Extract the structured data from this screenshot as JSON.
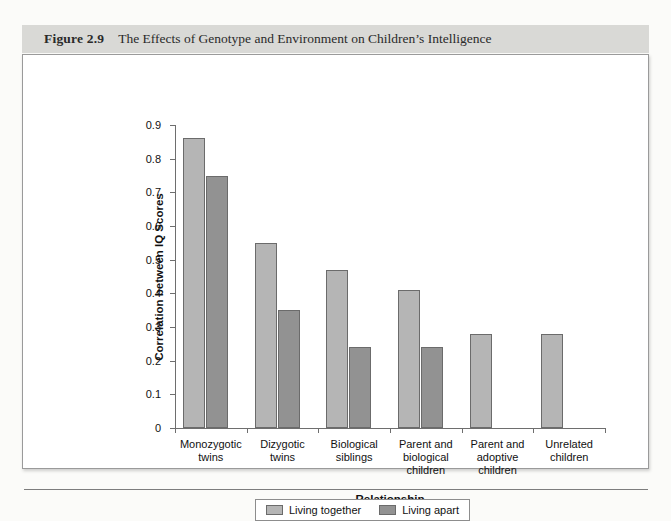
{
  "figure": {
    "number": "Figure 2.9",
    "title": "The Effects of Genotype and Environment on Children’s Intelligence"
  },
  "colors": {
    "together": "#b5b5b5",
    "apart": "#929292",
    "bar_border": "#6b6b6b",
    "axis": "#6e6e6e",
    "caption_band": "#d9d9d6",
    "frame_border": "#9a9a9a"
  },
  "chart_data": {
    "type": "bar",
    "title": "The Effects of Genotype and Environment on Children’s Intelligence",
    "xlabel": "Relationship",
    "ylabel": "Correlation between IQ Scores",
    "ylim": [
      0,
      0.9
    ],
    "ytick_labels": [
      "0",
      "0.1",
      "0.2",
      "0.3",
      "0.4",
      "0.5",
      "0.6",
      "0.7",
      "0.8",
      "0.9"
    ],
    "ytick_values": [
      0,
      0.1,
      0.2,
      0.3,
      0.4,
      0.5,
      0.6,
      0.7,
      0.8,
      0.9
    ],
    "grid": false,
    "legend_position": "bottom",
    "categories": [
      "Monozygotic twins",
      "Dizygotic twins",
      "Biological siblings",
      "Parent and biological children",
      "Parent and adoptive children",
      "Unrelated children"
    ],
    "category_lines": [
      [
        "Monozygotic",
        "twins"
      ],
      [
        "Dizygotic",
        "twins"
      ],
      [
        "Biological",
        "siblings"
      ],
      [
        "Parent and",
        "biological",
        "children"
      ],
      [
        "Parent and",
        "adoptive",
        "children"
      ],
      [
        "Unrelated",
        "children"
      ]
    ],
    "series": [
      {
        "name": "Living together",
        "color": "#b5b5b5",
        "values": [
          0.86,
          0.55,
          0.47,
          0.41,
          0.28,
          0.28
        ]
      },
      {
        "name": "Living apart",
        "color": "#929292",
        "values": [
          0.75,
          0.35,
          0.24,
          0.24,
          null,
          null
        ]
      }
    ]
  },
  "legend": {
    "items": [
      {
        "label": "Living together",
        "color": "#b5b5b5"
      },
      {
        "label": "Living apart",
        "color": "#929292"
      }
    ]
  }
}
